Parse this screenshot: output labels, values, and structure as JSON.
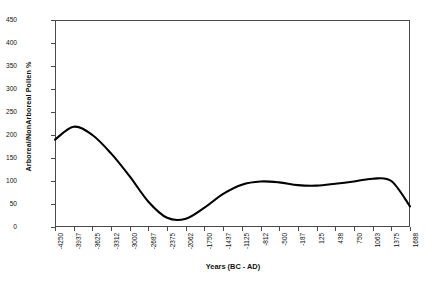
{
  "chart_data": {
    "type": "line",
    "title": "",
    "xlabel": "Years (BC - AD)",
    "ylabel": "Arboreal/NonArboreal Pollen %",
    "ylim": [
      0,
      450
    ],
    "y_ticks": [
      0,
      50,
      100,
      150,
      200,
      250,
      300,
      350,
      400,
      450
    ],
    "grid": false,
    "legend": false,
    "line_color": "#000000",
    "frame_color": "#4a4a4a",
    "categories": [
      "-4250",
      "-3937",
      "-3625",
      "-3312",
      "-3000",
      "-2687",
      "-2375",
      "-2062",
      "-1750",
      "-1437",
      "-1125",
      "-812",
      "-500",
      "-187",
      "125",
      "438",
      "750",
      "1063",
      "1375",
      "1688"
    ],
    "series": [
      {
        "name": "Arboreal/NonArboreal Pollen %",
        "values": [
          190,
          218,
          200,
          160,
          110,
          55,
          20,
          18,
          42,
          72,
          92,
          99,
          97,
          91,
          90,
          94,
          99,
          105,
          100,
          45
        ]
      }
    ]
  }
}
